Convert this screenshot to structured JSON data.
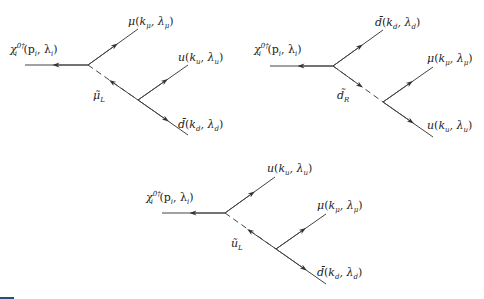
{
  "figure": {
    "type": "feynman-diagrams",
    "line_color": "#444444",
    "diagrams": [
      {
        "id": "diagram-1",
        "incoming": {
          "label": "χ_i^{0†}(p_i, λ_i)",
          "text": "χ",
          "sub": "i",
          "sup": "0†",
          "args": "(p",
          "args_sub": "i",
          "args2": ", λ",
          "args2_sub": "i",
          "close": ")"
        },
        "propagator": {
          "label": "μ̃_L",
          "text": "μ̃",
          "sub": "L",
          "style": "dashed",
          "arrow": "toward-first-vertex"
        },
        "outgoing": [
          {
            "label": "μ(k_μ, λ_μ)",
            "text": "μ",
            "k_sub": "μ",
            "l_sub": "μ",
            "vertex": 1
          },
          {
            "label": "u(k_u, λ_u)",
            "text": "u",
            "k_sub": "u",
            "l_sub": "u",
            "vertex": 2
          },
          {
            "label": "d̄(k_d, λ_d)",
            "text": "d̄",
            "k_sub": "d",
            "l_sub": "d",
            "vertex": 2
          }
        ]
      },
      {
        "id": "diagram-2",
        "incoming": {
          "label": "χ_i^{0†}(p_i, λ_i)",
          "text": "χ",
          "sub": "i",
          "sup": "0†",
          "args": "(p",
          "args_sub": "i",
          "args2": ", λ",
          "args2_sub": "i",
          "close": ")"
        },
        "propagator": {
          "label": "d̃_R",
          "text": "d̃",
          "sub": "R",
          "style": "dashed",
          "arrow": "toward-second-vertex"
        },
        "outgoing": [
          {
            "label": "d̄(k_d, λ_d)",
            "text": "d̄",
            "k_sub": "d",
            "l_sub": "d",
            "vertex": 1
          },
          {
            "label": "μ(k_μ, λ_μ)",
            "text": "μ",
            "k_sub": "μ",
            "l_sub": "μ",
            "vertex": 2
          },
          {
            "label": "u(k_u, λ_u)",
            "text": "u",
            "k_sub": "u",
            "l_sub": "u",
            "vertex": 2
          }
        ]
      },
      {
        "id": "diagram-3",
        "incoming": {
          "label": "χ_i^{0†}(p_i, λ_i)",
          "text": "χ",
          "sub": "i",
          "sup": "0†",
          "args": "(p",
          "args_sub": "i",
          "args2": ", λ",
          "args2_sub": "i",
          "close": ")"
        },
        "propagator": {
          "label": "ũ_L",
          "text": "ũ",
          "sub": "L",
          "style": "dashed",
          "arrow": "toward-first-vertex"
        },
        "outgoing": [
          {
            "label": "u(k_u, λ_u)",
            "text": "u",
            "k_sub": "u",
            "l_sub": "u",
            "vertex": 1
          },
          {
            "label": "μ(k_μ, λ_μ)",
            "text": "μ",
            "k_sub": "μ",
            "l_sub": "μ",
            "vertex": 2
          },
          {
            "label": "d̄(k_d, λ_d)",
            "text": "d̄",
            "k_sub": "d",
            "l_sub": "d",
            "vertex": 2
          }
        ]
      }
    ]
  }
}
